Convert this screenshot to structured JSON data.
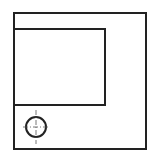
{
  "diagram": {
    "type": "orthographic-view",
    "background": "#ffffff",
    "stroke_color": "#222222",
    "outer_rect": {
      "x": 14,
      "y": 13,
      "width": 132,
      "height": 136,
      "stroke_width": 2
    },
    "inner_rect": {
      "x": 14,
      "y": 29,
      "width": 91,
      "height": 76,
      "stroke_width": 2
    },
    "hole": {
      "cx": 36,
      "cy": 127,
      "r": 10,
      "stroke_width": 2
    },
    "center_lines": {
      "horizontal": {
        "x1": 23,
        "y1": 127,
        "x2": 50,
        "y2": 127
      },
      "vertical": {
        "x1": 36,
        "y1": 110,
        "x2": 36,
        "y2": 144
      },
      "dash": "5,2,1,2",
      "color": "#555555"
    }
  }
}
